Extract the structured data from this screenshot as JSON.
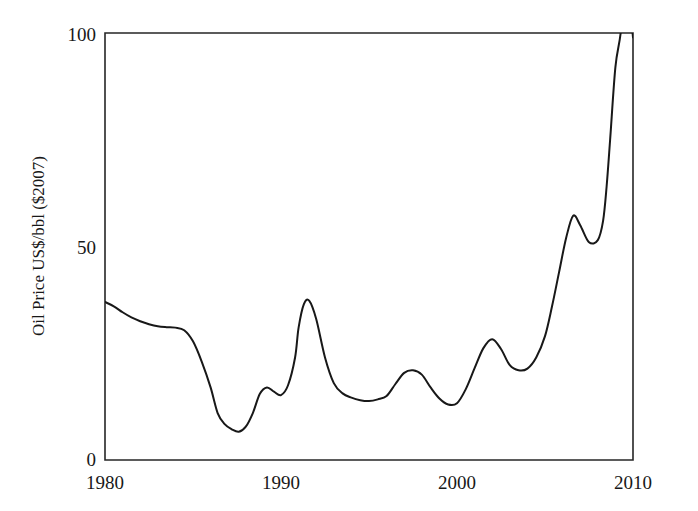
{
  "chart_data": {
    "type": "line",
    "title": "",
    "subtitle": "",
    "xlabel": "",
    "ylabel": "Oil Price US$/bbl ($2007)",
    "xlim": [
      1980,
      2010
    ],
    "ylim": [
      0,
      100
    ],
    "xticks": [
      1980,
      1990,
      2000,
      2010
    ],
    "xtick_labels": [
      "1980",
      "1990",
      "2000",
      "2010"
    ],
    "yticks": [
      0,
      50,
      100
    ],
    "ytick_labels": [
      "0",
      "50",
      "100"
    ],
    "grid": false,
    "legend": null,
    "legend_position": "none",
    "axis_style": "open-box-left-bottom",
    "line_color": "#181818",
    "background_color": "#ffffff",
    "annotations": [],
    "series": [
      {
        "name": "Oil Price US$/bbl ($2007)",
        "color": "#181818",
        "x": [
          1980.0,
          1980.5,
          1981.0,
          1981.5,
          1982.0,
          1982.5,
          1983.0,
          1983.5,
          1984.0,
          1984.5,
          1985.0,
          1985.5,
          1986.0,
          1986.4,
          1986.8,
          1987.2,
          1987.6,
          1988.0,
          1988.4,
          1988.8,
          1989.2,
          1989.6,
          1990.0,
          1990.4,
          1990.8,
          1991.0,
          1991.3,
          1991.6,
          1992.0,
          1992.5,
          1993.0,
          1993.5,
          1994.0,
          1994.5,
          1995.0,
          1995.5,
          1996.0,
          1996.5,
          1997.0,
          1997.5,
          1998.0,
          1998.5,
          1999.0,
          1999.5,
          2000.0,
          2000.5,
          2001.0,
          2001.5,
          2002.0,
          2002.5,
          2003.0,
          2003.5,
          2004.0,
          2004.5,
          2005.0,
          2005.4,
          2005.8,
          2006.2,
          2006.6,
          2007.0,
          2007.5,
          2008.0,
          2008.3,
          2008.5,
          2008.7,
          2009.0,
          2009.3,
          2009.6,
          2010.0
        ],
        "y": [
          37.0,
          36.0,
          34.6,
          33.4,
          32.5,
          31.8,
          31.3,
          31.1,
          31.0,
          30.4,
          27.8,
          23.0,
          17.0,
          11.0,
          8.4,
          7.2,
          6.6,
          7.8,
          11.0,
          15.5,
          17.0,
          16.0,
          15.2,
          17.5,
          24.0,
          31.0,
          36.5,
          37.3,
          33.0,
          24.0,
          18.0,
          15.6,
          14.6,
          14.0,
          13.8,
          14.2,
          15.0,
          17.8,
          20.4,
          21.0,
          20.0,
          17.0,
          14.4,
          13.0,
          13.3,
          16.6,
          21.5,
          26.2,
          28.3,
          26.0,
          22.2,
          21.0,
          21.4,
          24.0,
          29.0,
          36.0,
          44.0,
          52.0,
          57.2,
          55.0,
          51.0,
          51.5,
          56.0,
          64.0,
          75.0,
          92.0,
          100.0,
          113.0,
          99.0
        ]
      }
    ],
    "notable_points": [
      {
        "year": 1980,
        "value": 37.0,
        "label": "start of series"
      },
      {
        "year": 1984,
        "value": 31.0,
        "label": "pre-collapse plateau"
      },
      {
        "year": 1987.6,
        "value": 6.6,
        "label": "1986-87 price collapse low"
      },
      {
        "year": 1988.4,
        "value": 17.0,
        "label": "1988 rebound"
      },
      {
        "year": 1991.6,
        "value": 37.3,
        "label": "Gulf War peak"
      },
      {
        "year": 1994,
        "value": 14.0,
        "label": "mid-1990s trough"
      },
      {
        "year": 1997.5,
        "value": 21.0,
        "label": "1996-97 bump"
      },
      {
        "year": 1999.5,
        "value": 13.0,
        "label": "1998-99 low"
      },
      {
        "year": 2002,
        "value": 28.3,
        "label": "2000 peak"
      },
      {
        "year": 2002.5,
        "value": 21.0,
        "label": "2002 dip"
      },
      {
        "year": 2006.6,
        "value": 57.2,
        "label": "2005 local peak"
      },
      {
        "year": 2007.5,
        "value": 51.0,
        "label": "2006 pullback"
      },
      {
        "year": 2008.6,
        "value": 100.0,
        "label": "crosses top of axis in 2008"
      },
      {
        "year": 2009.0,
        "value": 31.0,
        "label": "2008-09 crash low"
      },
      {
        "year": 2010.0,
        "value": 65.0,
        "label": "2009-10 recovery, end of series"
      }
    ]
  },
  "figure": {
    "axis_title_y": "Oil Price US$/bbl ($2007)"
  }
}
